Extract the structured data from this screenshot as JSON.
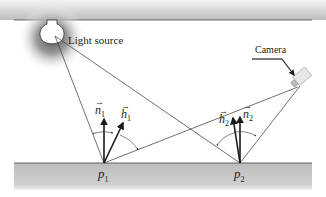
{
  "diagram": {
    "light_source_label": "Light source",
    "camera_label": "Camera",
    "points": [
      {
        "name": "p",
        "sub": "1"
      },
      {
        "name": "p",
        "sub": "2"
      }
    ],
    "vectors": [
      {
        "name": "n",
        "sub": "1"
      },
      {
        "name": "h",
        "sub": "1"
      },
      {
        "name": "h",
        "sub": "2"
      },
      {
        "name": "n",
        "sub": "2"
      }
    ],
    "colors": {
      "surface": "#c8c8c8",
      "line": "#333333",
      "arrow": "#1a1a1a"
    }
  }
}
